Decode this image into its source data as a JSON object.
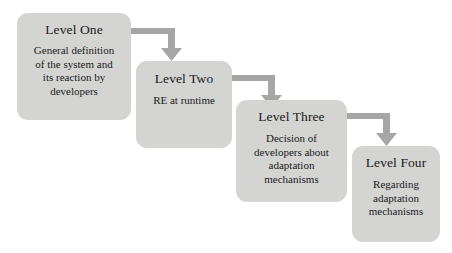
{
  "diagram": {
    "background_color": "#ffffff",
    "box_fill_color": "#d4d4d2",
    "arrow_color": "#a6a6a6",
    "text_color": "#1a1a1a",
    "levels": [
      {
        "id": "level-one",
        "title": "Level One",
        "body_lines": [
          "General definition",
          "of the system and",
          "its reaction by",
          "developers"
        ]
      },
      {
        "id": "level-two",
        "title": "Level Two",
        "body_lines": [
          "RE at runtime"
        ]
      },
      {
        "id": "level-three",
        "title": "Level Three",
        "body_lines": [
          "Decision of",
          "developers about",
          "adaptation",
          "mechanisms"
        ]
      },
      {
        "id": "level-four",
        "title": "Level Four",
        "body_lines": [
          "Regarding",
          "adaptation",
          "mechanisms"
        ]
      }
    ],
    "connectors": [
      {
        "id": "connector-one-to-two",
        "from": "level-one",
        "to": "level-two",
        "shape": "elbow-right-down"
      },
      {
        "id": "connector-two-to-three",
        "from": "level-two",
        "to": "level-three",
        "shape": "elbow-right-down"
      },
      {
        "id": "connector-three-to-four",
        "from": "level-three",
        "to": "level-four",
        "shape": "elbow-right-down"
      }
    ]
  }
}
